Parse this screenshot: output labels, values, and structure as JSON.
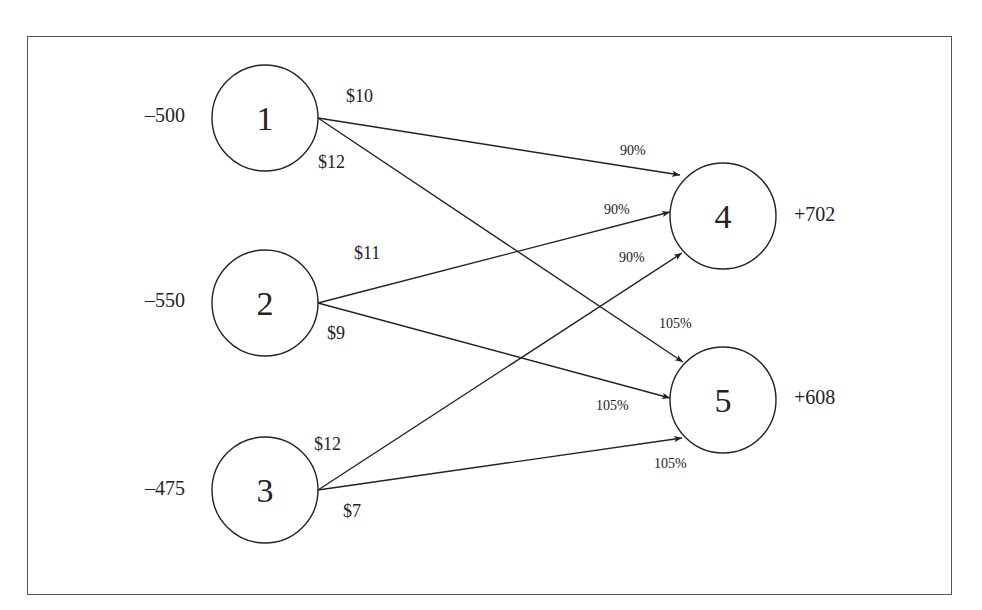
{
  "diagram": {
    "type": "generalized network flow",
    "sources": [
      {
        "id": "1",
        "supply": "–500",
        "cx": 265,
        "cy": 118
      },
      {
        "id": "2",
        "supply": "–550",
        "cx": 265,
        "cy": 303
      },
      {
        "id": "3",
        "supply": "–475",
        "cx": 265,
        "cy": 490
      }
    ],
    "sinks": [
      {
        "id": "4",
        "demand": "+702",
        "cx": 723,
        "cy": 216
      },
      {
        "id": "5",
        "demand": "+608",
        "cx": 723,
        "cy": 400
      }
    ],
    "arcs": [
      {
        "from": "1",
        "to": "4",
        "cost": "$10",
        "multiplier": "90%"
      },
      {
        "from": "1",
        "to": "5",
        "cost": "$12",
        "multiplier": "105%"
      },
      {
        "from": "2",
        "to": "4",
        "cost": "$11",
        "multiplier": "90%"
      },
      {
        "from": "2",
        "to": "5",
        "cost": "$9",
        "multiplier": "105%"
      },
      {
        "from": "3",
        "to": "4",
        "cost": "$12",
        "multiplier": "90%"
      },
      {
        "from": "3",
        "to": "5",
        "cost": "$7",
        "multiplier": "105%"
      }
    ]
  }
}
